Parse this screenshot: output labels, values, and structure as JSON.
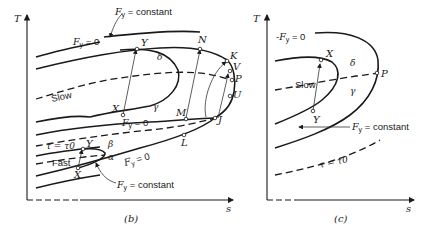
{
  "figure_b": {
    "caption": "(b)",
    "axis_y": "T",
    "axis_x": "s",
    "labels": {
      "fy_const_top": "Fy = constant",
      "fy_zero_top": "Fy = 0",
      "slow": "Slow",
      "fy_zero_mid": "Fy = 0",
      "tau": "τ = τ0",
      "fast": "Fast",
      "fy_zero_low": "Fy = 0",
      "fy_const_bottom": "Fy = constant"
    },
    "points": [
      "Y",
      "X",
      "N",
      "K",
      "V",
      "P",
      "U",
      "J",
      "M",
      "L",
      "Y",
      "X"
    ],
    "regions": [
      "δ",
      "γ",
      "β",
      "α"
    ]
  },
  "figure_c": {
    "caption": "(c)",
    "axis_y": "T",
    "axis_x": "s",
    "labels": {
      "fy_zero": "Fy = 0",
      "slow": "Slow",
      "fy_const": "Fy = constant",
      "tau": "τ = τ0"
    },
    "points": [
      "X",
      "Y",
      "P"
    ],
    "regions": [
      "δ",
      "γ"
    ]
  }
}
